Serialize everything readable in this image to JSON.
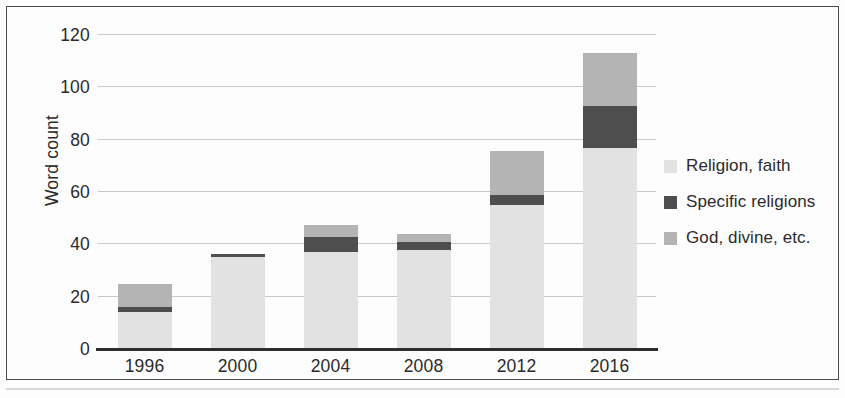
{
  "chart_data": {
    "type": "bar",
    "stacked": true,
    "title": "",
    "xlabel": "",
    "ylabel": "Word count",
    "categories": [
      "1996",
      "2000",
      "2004",
      "2008",
      "2012",
      "2016"
    ],
    "ylim": [
      0,
      120
    ],
    "yticks": [
      "0",
      "20",
      "40",
      "60",
      "80",
      "100",
      "120"
    ],
    "ytick_values": [
      0,
      20,
      40,
      60,
      80,
      100,
      120
    ],
    "grid": "horizontal",
    "legend_position": "right",
    "series": [
      {
        "name": "Religion, faith",
        "color": "#e2e2e2",
        "values": [
          14,
          35,
          37,
          38,
          55,
          77
        ]
      },
      {
        "name": "Specific religions",
        "color": "#4e4e4e",
        "values": [
          2,
          1.5,
          6,
          3,
          4,
          16
        ]
      },
      {
        "name": "God, divine, etc.",
        "color": "#b4b4b4",
        "values": [
          9,
          0,
          4.5,
          3,
          16.5,
          20
        ]
      }
    ],
    "totals": [
      25,
      36.5,
      47.5,
      44,
      75.5,
      113
    ]
  },
  "legend": {
    "items": [
      {
        "label": "Religion, faith",
        "color": "#e2e2e2"
      },
      {
        "label": "Specific religions",
        "color": "#4e4e4e"
      },
      {
        "label": "God, divine, etc.",
        "color": "#b4b4b4"
      }
    ]
  }
}
